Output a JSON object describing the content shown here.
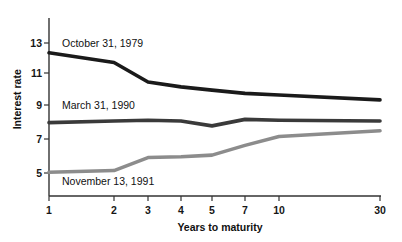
{
  "chart_data": {
    "type": "line",
    "title": "",
    "xlabel": "Years to maturity",
    "ylabel": "Interest rate",
    "x_tick_labels": [
      "1",
      "2",
      "3",
      "4",
      "5",
      "7",
      "10",
      "30"
    ],
    "x_values": [
      1,
      2,
      3,
      4,
      5,
      7,
      10,
      30
    ],
    "y_tick_labels": [
      "5",
      "7",
      "9",
      "11",
      "13"
    ],
    "y_ticks": [
      5,
      7,
      9,
      11,
      13
    ],
    "ylim": [
      3.9,
      13.9
    ],
    "grid": false,
    "legend_position": "inline-annotations",
    "series": [
      {
        "name": "October 31, 1979",
        "color": "#1a1a1a",
        "values": [
          12.4,
          11.8,
          10.6,
          10.3,
          10.1,
          9.9,
          9.8,
          9.5
        ]
      },
      {
        "name": "March 31, 1990",
        "color": "#3a3a3a",
        "values": [
          8.1,
          8.2,
          8.25,
          8.2,
          7.9,
          8.3,
          8.25,
          8.2
        ]
      },
      {
        "name": "November 13, 1991",
        "color": "#8c8c8c",
        "values": [
          5.05,
          5.15,
          5.95,
          6.0,
          6.1,
          6.7,
          7.25,
          7.6
        ]
      }
    ]
  },
  "axes": {
    "x_tick_px": [
      49,
      114,
      148,
      181,
      212,
      245,
      279,
      380
    ],
    "y_tick_px": [
      173,
      139,
      105,
      73,
      43
    ],
    "spine_x": 49,
    "spine_top": 18,
    "spine_bottom": 196,
    "spine_right": 381
  },
  "annotations": [
    {
      "text": "October 31, 1979"
    },
    {
      "text": "March 31, 1990"
    },
    {
      "text": "November 13, 1991"
    }
  ]
}
